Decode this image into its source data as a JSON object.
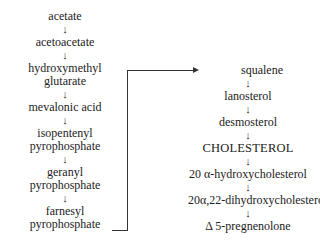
{
  "diagram": {
    "type": "biosynthesis-pathway",
    "left_column": [
      "acetate",
      "acetoacetate",
      "hydroxymethyl\nglutarate",
      "mevalonic acid",
      "isopentenyl\npyrophosphate",
      "geranyl\npyrophosphate",
      "farnesyl\npyrophosphate"
    ],
    "right_column": [
      "squalene",
      "lanosterol",
      "desmosterol",
      "CHOLESTEROL",
      "20 α-hydroxycholesterol",
      "20α,22-dihydroxycholesterol",
      "Δ 5-pregnenolone"
    ],
    "arrow_glyph": "↓",
    "connector": {
      "from": "farnesyl pyrophosphate",
      "to": "squalene"
    }
  }
}
